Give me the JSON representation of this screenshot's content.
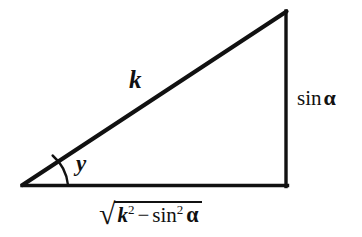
{
  "figure": {
    "background_color": "#ffffff",
    "stroke_color": "#111111",
    "geometry": {
      "left_vertex": [
        23,
        185
      ],
      "apex_vertex": [
        286,
        11
      ],
      "right_angle_vertex": [
        286,
        185
      ],
      "hypotenuse_width": 4,
      "base_width": 3,
      "vertical_width": 3,
      "angle_arc_radius": 45
    },
    "labels": {
      "hypotenuse": "k",
      "angle": "y",
      "vertical_leg_sin": "sin",
      "vertical_leg_alpha": "α",
      "base_radical": "√",
      "base_k": "k",
      "base_k_exponent": "2",
      "base_minus": "−",
      "base_sin": "sin",
      "base_sin_exponent": "2",
      "base_alpha": "α"
    }
  }
}
